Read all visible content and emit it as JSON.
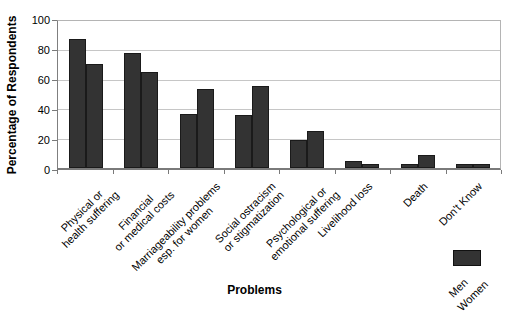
{
  "chart_data": {
    "type": "bar",
    "title": "",
    "xlabel": "Problems",
    "ylabel": "Percentage of Respondents",
    "ylim": [
      0,
      100
    ],
    "yticks": [
      0,
      20,
      40,
      60,
      80,
      100
    ],
    "grid": true,
    "legend_position": "bottom-right",
    "categories": [
      "Physical or\nhealth suffering",
      "Financial\nor medical costs",
      "Marriageability problems\nesp. for women",
      "Social ostracism\nor stigmatization",
      "Psychological or\nemotional suffering",
      "Livelihood loss",
      "Death",
      "Don't Know"
    ],
    "series": [
      {
        "name": "Men",
        "values": [
          88,
          78,
          37,
          36,
          19,
          5,
          3,
          3
        ]
      },
      {
        "name": "Women",
        "values": [
          71,
          65,
          54,
          56,
          25,
          3,
          9,
          3
        ]
      }
    ],
    "colors": {
      "bar": "#333333",
      "bar_border": "#1a1a1a",
      "gridline": "#c6c6c6",
      "axis": "#7a7a7a",
      "text": "#000000"
    }
  }
}
